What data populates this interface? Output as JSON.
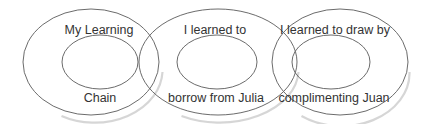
{
  "diagram": {
    "type": "nested-ellipse-chain",
    "colors": {
      "stroke": "#5a5a5a",
      "text": "#333333",
      "shadow": "#c8c8c8",
      "background": "#ffffff"
    },
    "nodes": [
      {
        "id": "my-learning-chain",
        "top_label": "My Learning",
        "bottom_label": "Chain"
      },
      {
        "id": "borrow-from-julia",
        "top_label": "I learned to",
        "bottom_label": "borrow from Julia"
      },
      {
        "id": "complimenting-juan",
        "top_label": "I learned to draw by",
        "bottom_label": "complimenting Juan"
      }
    ]
  }
}
